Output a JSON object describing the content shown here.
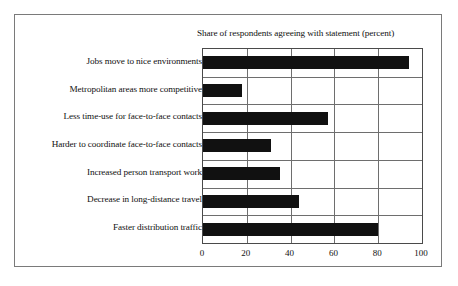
{
  "chart_data": {
    "type": "bar",
    "orientation": "horizontal",
    "title": "Share of respondents agreeing with statement (percent)",
    "xlabel": "",
    "ylabel": "",
    "xlim": [
      0,
      100
    ],
    "xticks": [
      0,
      20,
      40,
      60,
      80,
      100
    ],
    "grid": "vertical-and-horizontal",
    "legend": "none",
    "bar_color": "#111111",
    "categories": [
      "Jobs move to nice environments",
      "Metropolitan areas more competitive",
      "Less time-use for face-to-face contacts",
      "Harder to coordinate face-to-face contacts",
      "Increased person transport work",
      "Decrease in long-distance travel",
      "Faster distribution traffic"
    ],
    "values": [
      94,
      18,
      57,
      31,
      35,
      44,
      80
    ]
  },
  "figure": {
    "frame_color": "#7a7a7a",
    "background": "#ffffff"
  }
}
